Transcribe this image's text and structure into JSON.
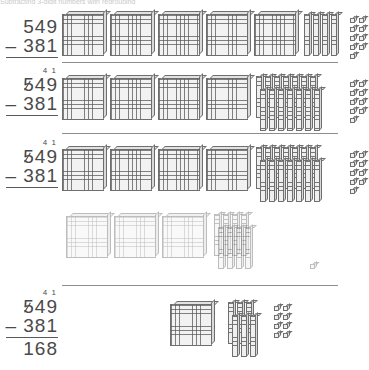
{
  "page": {
    "cut_off_header": "Subtracting 3-digit numbers with regrouping",
    "width": 338,
    "height": 370,
    "background": "#ffffff",
    "ink_color": "#4a4a4a",
    "rule_color": "#8d8d8d"
  },
  "problem": {
    "minuend": "549",
    "subtrahend": "381",
    "operator": "–",
    "difference": "168",
    "regroup_hundreds": "4",
    "regroup_tens": "1",
    "regrouped_digit": "5"
  },
  "steps": [
    {
      "id": "step-1",
      "label": "Start: show 549",
      "calc": {
        "regroup": "",
        "top": "549",
        "bottom": "– 381",
        "answer": ""
      },
      "blocks": {
        "hundreds": 5,
        "tens": 4,
        "ones": 9,
        "faded": false
      }
    },
    {
      "id": "step-2",
      "label": "Regroup 1 hundred into 10 tens",
      "calc": {
        "regroup": "4  1",
        "top": "549",
        "bottom": "– 381",
        "answer": ""
      },
      "blocks": {
        "hundreds": 4,
        "tens": 14,
        "ones": 9,
        "faded": false
      }
    },
    {
      "id": "step-3",
      "label": "Take away 381",
      "calc": {
        "regroup": "4  1",
        "top": "549",
        "bottom": "– 381",
        "answer": ""
      },
      "blocks": {
        "hundreds": 4,
        "tens": 14,
        "ones": 9,
        "faded": false
      },
      "removed": {
        "hundreds": 3,
        "tens": 8,
        "ones": 1,
        "faded": true
      }
    },
    {
      "id": "step-4",
      "label": "What is left: 168",
      "calc": {
        "regroup": "4  1",
        "top": "549",
        "bottom": "– 381",
        "answer": "168"
      },
      "blocks": {
        "hundreds": 1,
        "tens": 6,
        "ones": 8,
        "faded": false
      }
    }
  ],
  "legend": {
    "hundred_name": "hundred-flat",
    "ten_name": "ten-rod",
    "one_name": "unit-cube"
  }
}
